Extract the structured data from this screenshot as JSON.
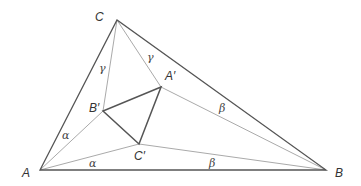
{
  "diagram": {
    "title": "",
    "vertices": {
      "A": {
        "label": "A",
        "x": 40,
        "y": 170
      },
      "B": {
        "label": "B",
        "x": 326,
        "y": 170
      },
      "C": {
        "label": "C",
        "x": 117,
        "y": 20
      },
      "A_prime": {
        "label": "A′",
        "x": 161,
        "y": 87
      },
      "B_prime": {
        "label": "B′",
        "x": 103,
        "y": 111
      },
      "C_prime": {
        "label": "C′",
        "x": 139,
        "y": 144
      }
    },
    "angle_labels": {
      "alpha_upper": "α",
      "alpha_lower": "α",
      "beta_upper": "β",
      "beta_lower": "β",
      "gamma_left": "γ",
      "gamma_right": "γ"
    },
    "colors": {
      "outer_triangle": "#555555",
      "inner_triangle": "#555555",
      "trisectors": "#aaaaaa",
      "text": "#333333"
    }
  }
}
